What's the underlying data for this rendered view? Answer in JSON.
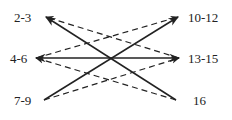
{
  "diagram": {
    "nodes_left": [
      {
        "id": "n23",
        "label": "2-3"
      },
      {
        "id": "n46",
        "label": "4-6"
      },
      {
        "id": "n79",
        "label": "7-9"
      }
    ],
    "nodes_right": [
      {
        "id": "n1012",
        "label": "10-12"
      },
      {
        "id": "n1315",
        "label": "13-15"
      },
      {
        "id": "n16",
        "label": "16"
      }
    ],
    "edges": [
      {
        "from": "n1315",
        "to": "n23",
        "style": "dashed"
      },
      {
        "from": "n46",
        "to": "n1012",
        "style": "dashed"
      },
      {
        "from": "n16",
        "to": "n46",
        "style": "dashed"
      },
      {
        "from": "n79",
        "to": "n1315",
        "style": "dashed"
      },
      {
        "from": "n16",
        "to": "n23",
        "style": "solid"
      },
      {
        "from": "n79",
        "to": "n1012",
        "style": "solid"
      },
      {
        "from": "n46",
        "to": "n1315",
        "style": "solid",
        "bidirectional": true
      }
    ],
    "colors": {
      "line": "#222222",
      "text": "#222222"
    }
  }
}
